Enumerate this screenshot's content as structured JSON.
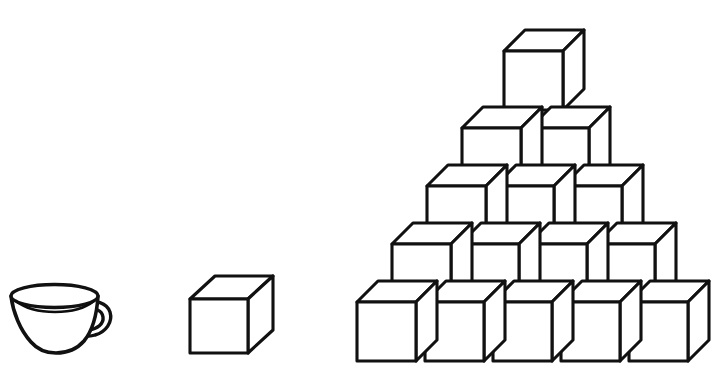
{
  "scene": {
    "title": "Cube pyramid with teacup and single cube",
    "width": 725,
    "height": 390,
    "background_color": "#ffffff",
    "ink_color": "#111111",
    "style": "black and white line drawing"
  },
  "objects": [
    {
      "name": "teacup",
      "label": "Teacup",
      "count": 1,
      "position": {
        "x": 8,
        "y": 283,
        "width": 112,
        "height": 76
      }
    },
    {
      "name": "single-cube",
      "label": "Single cube",
      "count": 1,
      "position": {
        "x": 188,
        "y": 276,
        "width": 88,
        "height": 78
      }
    },
    {
      "name": "cube-pyramid",
      "label": "Cube pyramid",
      "count": 15,
      "position": {
        "x": 355,
        "y": 26,
        "width": 355,
        "height": 335
      }
    }
  ],
  "cube_geometry": {
    "face_size": 59,
    "depth_dx": 21,
    "depth_dy": -21,
    "stroke_width": 3.1
  },
  "pyramid": {
    "row_count": 5,
    "total_cubes": 15,
    "row_vertical_pitch": 58,
    "column_horizontal_pitch": 68,
    "row_indent": 35,
    "rows": [
      {
        "index": 1,
        "label": "Bottom row",
        "cube_count": 5,
        "baseline_y": 302,
        "origins_x": [
          357,
          425,
          493,
          561,
          629
        ]
      },
      {
        "index": 2,
        "label": "Fourth row",
        "cube_count": 4,
        "baseline_y": 244,
        "origins_x": [
          392,
          460,
          528,
          596
        ]
      },
      {
        "index": 3,
        "label": "Third row",
        "cube_count": 3,
        "baseline_y": 186,
        "origins_x": [
          427,
          495,
          563
        ]
      },
      {
        "index": 4,
        "label": "Second row",
        "cube_count": 2,
        "baseline_y": 128,
        "origins_x": [
          462,
          530
        ]
      },
      {
        "index": 5,
        "label": "Top row",
        "cube_count": 1,
        "baseline_y": 51,
        "origins_x": [
          504
        ]
      }
    ]
  },
  "single_cube": {
    "label": "Standalone cube",
    "origin_x": 190,
    "origin_y": 299,
    "face_size": 58,
    "depth_dx": 25,
    "depth_dy": -23
  },
  "teacup": {
    "label": "Teacup with handle",
    "rim_center_x": 54,
    "rim_center_y": 296,
    "rim_radius_x": 44,
    "rim_radius_y": 11,
    "bowl_bottom_y": 353,
    "handle_center_x": 98,
    "handle_center_y": 315
  }
}
